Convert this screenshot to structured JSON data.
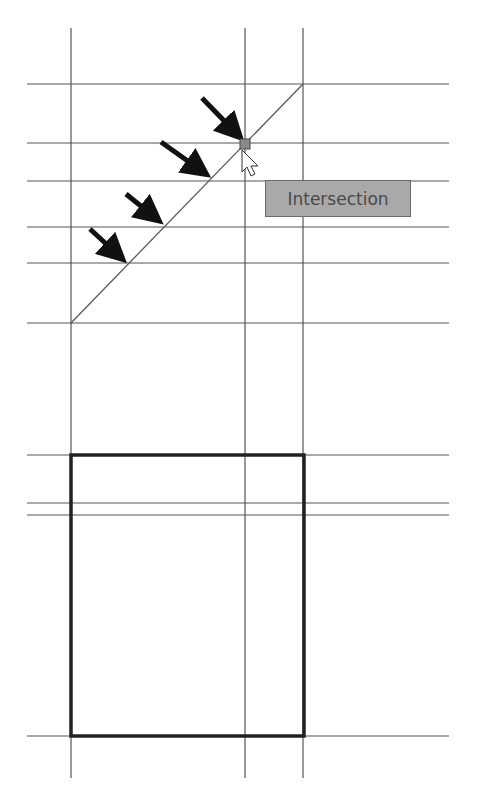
{
  "drawing": {
    "vertical_lines_x": [
      71,
      245,
      303
    ],
    "vertical_top": 28,
    "vertical_bottom": 778,
    "horizontal_lines_y": [
      84,
      143,
      181,
      227,
      263,
      323,
      455,
      503,
      515,
      736
    ],
    "horizontal_left": 27,
    "horizontal_right": 449,
    "diagonal": {
      "x1": 71,
      "y1": 323,
      "x2": 303,
      "y2": 84
    },
    "rectangle": {
      "x": 71,
      "y": 455,
      "width": 233,
      "height": 281
    },
    "snap_marker": {
      "x": 245,
      "y": 144
    },
    "arrows": [
      {
        "x1": 202,
        "y1": 98,
        "x2": 240,
        "y2": 137
      },
      {
        "x1": 161,
        "y1": 142,
        "x2": 205,
        "y2": 175
      },
      {
        "x1": 126,
        "y1": 194,
        "x2": 158,
        "y2": 221
      },
      {
        "x1": 90,
        "y1": 229,
        "x2": 122,
        "y2": 259
      }
    ],
    "colors": {
      "line": "#555555",
      "rect": "#222222",
      "arrow": "#111111",
      "snap_marker": "#8a8a8a"
    }
  },
  "tooltip": {
    "label": "Intersection",
    "background": "#a9a9a9"
  }
}
